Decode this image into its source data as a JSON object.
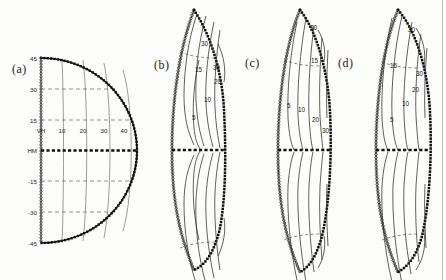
{
  "figure": {
    "background_color": "#fdfdfc",
    "ink_color": "#111111",
    "panel_count": 4
  },
  "panels": [
    {
      "id": "a",
      "label": "(a)",
      "type": "coordinate-grid",
      "description": "half-ellipse meridional grid",
      "y_axis": {
        "name": "latitude",
        "ticks": [
          "45",
          "30",
          "15",
          "HM",
          "-15",
          "-30",
          "-45"
        ],
        "origin_label": "VH",
        "midline_label": "HM"
      },
      "x_axis": {
        "name": "distance",
        "ticks": [
          "VH",
          "10",
          "20",
          "30",
          "40"
        ]
      }
    },
    {
      "id": "b",
      "label": "(b)",
      "type": "contour-map",
      "contour_labels": [
        "30",
        "15",
        "30",
        "20",
        "10",
        "5"
      ]
    },
    {
      "id": "c",
      "label": "(c)",
      "type": "contour-map",
      "contour_labels": [
        "30",
        "15",
        "5",
        "10",
        "20",
        "30"
      ]
    },
    {
      "id": "d",
      "label": "(d)",
      "type": "contour-map",
      "contour_labels": [
        "30",
        "15",
        "30",
        "20",
        "10",
        "5"
      ]
    }
  ],
  "chart_data": {
    "type": "line",
    "title": "",
    "xlabel": "",
    "ylabel": "",
    "subplots": [
      {
        "panel": "a",
        "type": "grid",
        "xlim": [
          0,
          45
        ],
        "ylim": [
          -45,
          45
        ],
        "xticks": [
          0,
          10,
          20,
          30,
          40
        ],
        "xticklabels": [
          "VH",
          "10",
          "20",
          "30",
          "40"
        ],
        "yticks": [
          45,
          30,
          15,
          0,
          -15,
          -30,
          -45
        ],
        "yticklabels": [
          "45",
          "30",
          "15",
          "HM",
          "-15",
          "-30",
          "-45"
        ],
        "grid": true,
        "meridian_values": [
          10,
          20,
          30,
          40
        ],
        "parallel_values": [
          30,
          15,
          -15,
          -30
        ]
      },
      {
        "panel": "b",
        "type": "contour",
        "levels": [
          5,
          10,
          15,
          20,
          30
        ],
        "labeled_levels": [
          "30",
          "15",
          "30",
          "20",
          "10",
          "5"
        ],
        "symmetry": "north-south mirrored about HM"
      },
      {
        "panel": "c",
        "type": "contour",
        "levels": [
          5,
          10,
          15,
          20,
          30
        ],
        "labeled_levels": [
          "30",
          "15",
          "5",
          "10",
          "20",
          "30"
        ],
        "symmetry": "north-south mirrored about HM"
      },
      {
        "panel": "d",
        "type": "contour",
        "levels": [
          5,
          10,
          15,
          20,
          30
        ],
        "labeled_levels": [
          "30",
          "15",
          "30",
          "20",
          "10",
          "5"
        ],
        "symmetry": "north-south mirrored about HM"
      }
    ]
  }
}
